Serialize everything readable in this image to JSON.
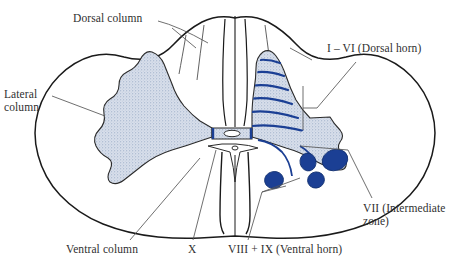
{
  "figure": {
    "name": "spinal-cord-cross-section",
    "colors": {
      "outline": "#1a1a1a",
      "gray_matter_fill": "#ccd5e4",
      "lamina_line": "#1b3f94",
      "motor_nucleus": "#1b3f94",
      "leader_line": "#555555",
      "label_text": "#303030",
      "background": "#ffffff"
    }
  },
  "labels": {
    "dorsal_column": "Dorsal column",
    "lateral_column": "Lateral\ncolumn",
    "dorsal_horn": "I – VI (Dorsal horn)",
    "intermediate_zone": "VII (Intermediate\nzone)",
    "ventral_column": "Ventral column",
    "lamina_x": "X",
    "ventral_horn": "VIII + IX (Ventral horn)"
  },
  "anatomy": {
    "white_matter_columns": [
      "Dorsal column",
      "Lateral column",
      "Ventral column"
    ],
    "gray_matter_regions": [
      "I – VI (Dorsal horn)",
      "VII (Intermediate zone)",
      "VIII + IX (Ventral horn)",
      "X"
    ],
    "lamina_stripe_count": 6,
    "motor_nucleus_count": 4,
    "central_canal": "central-canal"
  }
}
